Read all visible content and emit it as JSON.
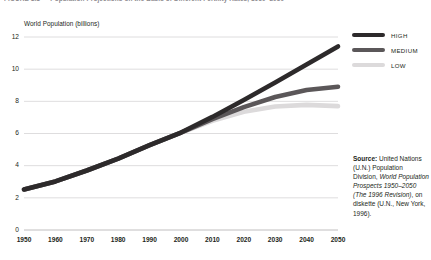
{
  "figure": {
    "title": "FIGURE 1.1  —  Population Projections on the Basis of Different Fertility Rates, 1950–2050",
    "axis_caption": "World Population (billions)"
  },
  "legend": {
    "position": "right",
    "items": [
      {
        "label": "HIGH",
        "color": "#2d2a2b"
      },
      {
        "label": "MEDIUM",
        "color": "#5b5759"
      },
      {
        "label": "LOW",
        "color": "#dcdadb"
      }
    ]
  },
  "source": {
    "label": "Source:",
    "text_1": " United Nations (U.N.) Population Division, ",
    "italic_1": "World Population Prospects 1950–2050 (The 1996 Revision)",
    "text_2": ", on diskette (U.N., New York, 1996)."
  },
  "chart_data": {
    "type": "line",
    "title": "Population Projections on the Basis of Different Fertility Rates, 1950–2050",
    "xlabel": "",
    "ylabel": "World Population (billions)",
    "xlim": [
      1950,
      2050
    ],
    "ylim": [
      0,
      12
    ],
    "ytick_labels": [
      "12",
      "10",
      "8",
      "6",
      "4",
      "2",
      "0"
    ],
    "yticks": [
      12,
      10,
      8,
      6,
      4,
      2,
      0
    ],
    "xtick_labels": [
      "1950",
      "1960",
      "1970",
      "1980",
      "1990",
      "2000",
      "2010",
      "2020",
      "2030",
      "2040",
      "2050"
    ],
    "xticks": [
      1950,
      1960,
      1970,
      1980,
      1990,
      2000,
      2010,
      2020,
      2030,
      2040,
      2050
    ],
    "grid": "horizontal",
    "legend_position": "right",
    "x": [
      1950,
      1960,
      1970,
      1980,
      1990,
      2000,
      2010,
      2020,
      2030,
      2040,
      2050
    ],
    "series": [
      {
        "name": "HIGH",
        "color": "#2d2a2b",
        "values": [
          2.52,
          3.02,
          3.7,
          4.44,
          5.27,
          6.06,
          7.03,
          8.08,
          9.17,
          10.29,
          11.41
        ]
      },
      {
        "name": "MEDIUM",
        "color": "#5b5759",
        "values": [
          2.52,
          3.02,
          3.7,
          4.44,
          5.27,
          6.06,
          6.89,
          7.64,
          8.27,
          8.7,
          8.91
        ]
      },
      {
        "name": "LOW",
        "color": "#dcdadb",
        "values": [
          2.52,
          3.02,
          3.7,
          4.44,
          5.27,
          6.06,
          6.79,
          7.35,
          7.68,
          7.78,
          7.7
        ]
      }
    ]
  }
}
